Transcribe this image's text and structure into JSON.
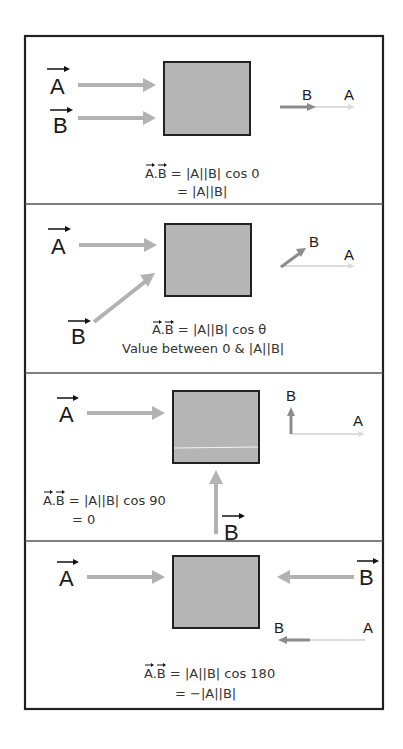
{
  "diagram": {
    "panels": [
      {
        "id": "angle-0",
        "input_labels": [
          "A",
          "B"
        ],
        "result_labels": {
          "b": "B",
          "a": "A"
        },
        "equation_line1_prefix": "A.B",
        "equation_line1": " = |A||B| cos 0",
        "equation_line2": "= |A||B|"
      },
      {
        "id": "angle-theta",
        "input_labels": [
          "A",
          "B"
        ],
        "result_labels": {
          "b": "B",
          "a": "A"
        },
        "equation_line1_prefix": "A.B",
        "equation_line1": " = |A||B| cos θ",
        "equation_line2": "Value between 0 & |A||B|"
      },
      {
        "id": "angle-90",
        "input_labels": [
          "A",
          "B"
        ],
        "result_labels": {
          "b": "B",
          "a": "A"
        },
        "equation_line1_prefix": "A.B",
        "equation_line1": " = |A||B| cos 90",
        "equation_line2": "= 0"
      },
      {
        "id": "angle-180",
        "input_labels": [
          "A",
          "B"
        ],
        "result_labels": {
          "b": "B",
          "a": "A"
        },
        "equation_line1_prefix": "A.B",
        "equation_line1": " = |A||B| cos 180",
        "equation_line2": "= −|A||B|"
      }
    ],
    "colors": {
      "box_fill": "#b5b5b5",
      "input_arrow": "#b2b2b2",
      "result_b_arrow": "#8c8c8c",
      "result_a_arrow": "#dcdcdc",
      "border": "#222222"
    }
  }
}
